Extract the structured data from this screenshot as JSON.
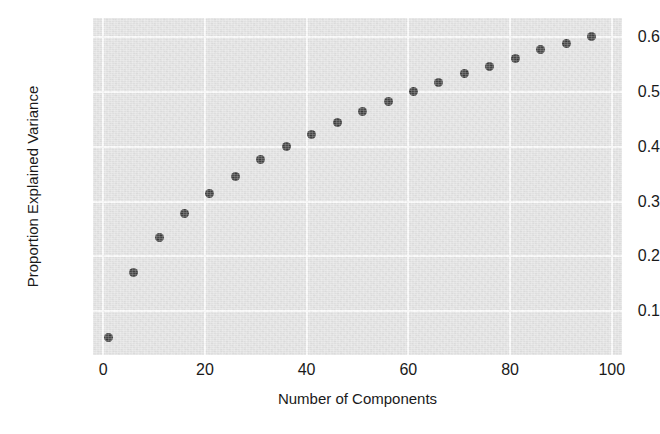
{
  "chart_data": {
    "type": "scatter",
    "title": "",
    "xlabel": "Number of Components",
    "ylabel": "Proportion Explained Variance",
    "xlim": [
      -2,
      102
    ],
    "ylim": [
      0.02,
      0.635
    ],
    "xticks": [
      "0",
      "20",
      "40",
      "60",
      "80",
      "100"
    ],
    "xtick_values": [
      0,
      20,
      40,
      60,
      80,
      100
    ],
    "yticks": [
      "0.1",
      "0.2",
      "0.3",
      "0.4",
      "0.5",
      "0.6"
    ],
    "ytick_values": [
      0.1,
      0.2,
      0.3,
      0.4,
      0.5,
      0.6
    ],
    "grid": true,
    "legend": null,
    "marker_color": "#3b3b3b",
    "panel_color": "#e3e3e3",
    "grid_color": "#fbfbfb",
    "x": [
      1,
      6,
      11,
      16,
      21,
      26,
      31,
      36,
      41,
      46,
      51,
      56,
      61,
      66,
      71,
      76,
      81,
      86,
      91,
      96
    ],
    "y": [
      0.052,
      0.17,
      0.234,
      0.279,
      0.314,
      0.346,
      0.377,
      0.4,
      0.423,
      0.445,
      0.464,
      0.482,
      0.5,
      0.518,
      0.534,
      0.546,
      0.561,
      0.577,
      0.588,
      0.602
    ]
  }
}
